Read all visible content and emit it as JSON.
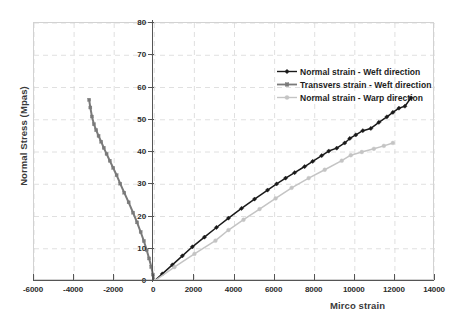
{
  "chart_data": {
    "type": "line",
    "title": "",
    "xlabel": "Mirco strain",
    "ylabel": "Normal Stress (Mpas)",
    "xlim": [
      -6000,
      14000
    ],
    "ylim": [
      0,
      80
    ],
    "xticks": [
      -6000,
      -4000,
      -2000,
      0,
      2000,
      4000,
      6000,
      8000,
      10000,
      12000,
      14000
    ],
    "yticks": [
      0,
      10,
      20,
      30,
      40,
      50,
      60,
      70,
      80
    ],
    "grid": true,
    "legend_position": "upper-right-inside",
    "series": [
      {
        "name": "Normal strain - Weft direction",
        "color": "#1a1a1a",
        "marker": "diamond",
        "x": [
          0,
          400,
          900,
          1400,
          1900,
          2500,
          3100,
          3700,
          4350,
          5000,
          5650,
          6100,
          6550,
          7000,
          7500,
          7900,
          8350,
          8700,
          9100,
          9500,
          9750,
          10050,
          10400,
          10800,
          11200,
          11600,
          11900,
          12200,
          12500,
          12800
        ],
        "y": [
          0,
          2.2,
          5.0,
          7.8,
          10.6,
          13.6,
          16.6,
          19.5,
          22.5,
          25.4,
          28.2,
          30.1,
          31.9,
          33.6,
          35.5,
          37.1,
          38.9,
          40.3,
          41.2,
          42.8,
          44.2,
          45.3,
          46.6,
          47.3,
          49.2,
          50.9,
          52.3,
          53.6,
          54.2,
          56.8
        ]
      },
      {
        "name": "Transvers strain - Weft direction",
        "color": "#7a7a7a",
        "marker": "square",
        "x": [
          0,
          -70,
          -150,
          -260,
          -380,
          -520,
          -680,
          -860,
          -1060,
          -1280,
          -1500,
          -1700,
          -1880,
          -2050,
          -2220,
          -2380,
          -2520,
          -2650,
          -2780,
          -2900,
          -3010,
          -3110,
          -3190,
          -3250
        ],
        "y": [
          0,
          2.0,
          4.4,
          7.0,
          9.6,
          12.4,
          15.2,
          18.2,
          21.2,
          24.4,
          27.4,
          30.2,
          32.8,
          35.1,
          37.3,
          39.4,
          41.3,
          43.2,
          45.0,
          46.8,
          48.6,
          51.0,
          53.8,
          56.2
        ]
      },
      {
        "name": "Normal strain - Warp direction",
        "color": "#c4c4c4",
        "marker": "circle",
        "x": [
          0,
          1000,
          2000,
          3050,
          3700,
          4450,
          5250,
          6050,
          6850,
          7700,
          8500,
          9350,
          9800,
          10350,
          10950,
          11450,
          11900
        ],
        "y": [
          0,
          4.3,
          8.4,
          12.5,
          15.8,
          19.0,
          22.3,
          25.6,
          28.9,
          31.9,
          34.5,
          37.3,
          39.0,
          40.0,
          41.0,
          41.9,
          42.8
        ]
      }
    ]
  }
}
